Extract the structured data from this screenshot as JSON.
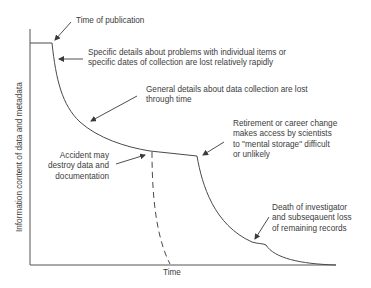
{
  "diagram": {
    "type": "information-decay-curve",
    "axes": {
      "xlabel": "Time",
      "ylabel": "Information content of data and metadata"
    },
    "annotations": [
      {
        "id": "publication",
        "lines": [
          "Time of publication"
        ]
      },
      {
        "id": "specific-details",
        "lines": [
          "Specific details about problems with individual items or",
          "specific dates of collection are lost relatively rapidly"
        ]
      },
      {
        "id": "general-details",
        "lines": [
          "General details about data collection are lost",
          "through time"
        ]
      },
      {
        "id": "retirement",
        "lines": [
          "Retirement or career change",
          "makes access by scientists",
          "to \"mental storage\" difficult",
          "or unlikely"
        ]
      },
      {
        "id": "accident",
        "lines": [
          "Accident may",
          "destroy data and",
          "documentation"
        ]
      },
      {
        "id": "death",
        "lines": [
          "Death of investigator",
          "and subseqauent loss",
          "of remaining records"
        ]
      }
    ],
    "colors": {
      "line": "#4a4a4a",
      "text": "#3c3c3c",
      "background": "#ffffff"
    }
  }
}
